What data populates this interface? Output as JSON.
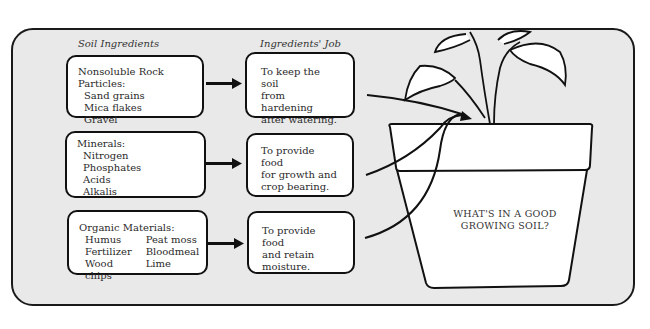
{
  "headers": {
    "ingredients": "Soil Ingredients",
    "jobs": "Ingredients' Job"
  },
  "ingredients": [
    {
      "title": "Nonsoluble Rock Particles:",
      "items": [
        "Sand grains",
        "Mica flakes",
        "Gravel"
      ]
    },
    {
      "title": "Minerals:",
      "items": [
        "Nitrogen",
        "Phosphates",
        "Acids",
        "Alkalis"
      ]
    },
    {
      "title": "Organic Materials:",
      "columns": [
        [
          "Humus",
          "Fertilizer",
          "Wood chips"
        ],
        [
          "Peat moss",
          "Bloodmeal",
          "Lime"
        ]
      ]
    }
  ],
  "jobs": [
    {
      "line1": "To keep the soil",
      "line2": "from hardening",
      "line3": "after watering."
    },
    {
      "line1": "To provide food",
      "line2": "for growth and",
      "line3": "crop bearing."
    },
    {
      "line1": "To provide food",
      "line2": "and retain moisture."
    }
  ],
  "pot": {
    "line1": "WHAT'S IN A GOOD",
    "line2": "GROWING SOIL?"
  },
  "icons": {
    "arrow": "right-arrow-icon",
    "plant": "plant-icon",
    "pot": "flower-pot-icon"
  },
  "colors": {
    "panel_bg": "#e9e9e9",
    "box_bg": "#ffffff",
    "stroke": "#111111"
  }
}
